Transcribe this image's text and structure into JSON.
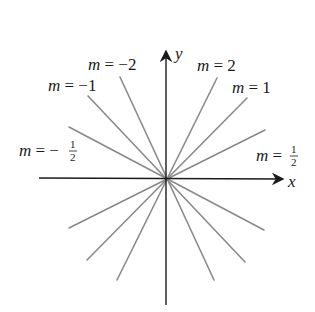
{
  "diagram": {
    "type": "family-of-lines-through-origin",
    "axes": {
      "x_label": "x",
      "y_label": "y",
      "color": "#1a1a1a"
    },
    "line_color": "#8a8a8a",
    "center": [
      166,
      179
    ],
    "lines": [
      {
        "slope_label": "m = 2",
        "var": "m",
        "eq": "=",
        "value": "2",
        "x1": 117,
        "y1": 280,
        "x2": 217,
        "y2": 78
      },
      {
        "slope_label": "m = 1",
        "var": "m",
        "eq": "=",
        "value": "1",
        "x1": 87,
        "y1": 260,
        "x2": 247,
        "y2": 98
      },
      {
        "slope_label": "m = 1/2",
        "var": "m",
        "eq": "=",
        "value": "1/2",
        "x1": 69,
        "y1": 228,
        "x2": 265,
        "y2": 130
      },
      {
        "slope_label": "m = -2",
        "var": "m",
        "eq": "=",
        "value": "−2",
        "x1": 120,
        "y1": 77,
        "x2": 214,
        "y2": 280
      },
      {
        "slope_label": "m = -1",
        "var": "m",
        "eq": "=",
        "value": "−1",
        "x1": 88,
        "y1": 96,
        "x2": 245,
        "y2": 262
      },
      {
        "slope_label": "m = -1/2",
        "var": "m",
        "eq": "=",
        "value": "−1/2",
        "x1": 69,
        "y1": 127,
        "x2": 264,
        "y2": 230
      }
    ],
    "labels": {
      "m_neg2": {
        "var": "m",
        "rest": " = −2"
      },
      "m_neg1": {
        "var": "m",
        "rest": " = −1"
      },
      "m_neghalf": {
        "var": "m",
        "rest": " = −",
        "num": "1",
        "den": "2"
      },
      "m_2": {
        "var": "m",
        "rest": " = 2"
      },
      "m_1": {
        "var": "m",
        "rest": " = 1"
      },
      "m_half": {
        "var": "m",
        "rest": " = ",
        "num": "1",
        "den": "2"
      }
    }
  }
}
